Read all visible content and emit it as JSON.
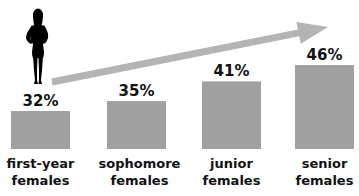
{
  "chart_data": {
    "type": "bar",
    "title": "",
    "xlabel": "",
    "ylabel": "",
    "categories": [
      [
        "first-year",
        "females"
      ],
      [
        "sophomore",
        "females"
      ],
      [
        "junior",
        "females"
      ],
      [
        "senior",
        "females"
      ]
    ],
    "values": [
      32,
      35,
      41,
      46
    ],
    "value_labels": [
      "32%",
      "35%",
      "41%",
      "46%"
    ],
    "units": "%",
    "grid": false,
    "legend": "none",
    "annotations": [
      {
        "type": "trend-arrow",
        "direction": "increasing",
        "from_category": 0,
        "to_category": 3
      },
      {
        "type": "icon",
        "name": "female-silhouette-icon",
        "placement": "above-first-bar"
      }
    ]
  },
  "colors": {
    "bar": "#a0a0a0",
    "arrow": "#b4b4b4",
    "text": "#111111",
    "silhouette": "#000000"
  }
}
